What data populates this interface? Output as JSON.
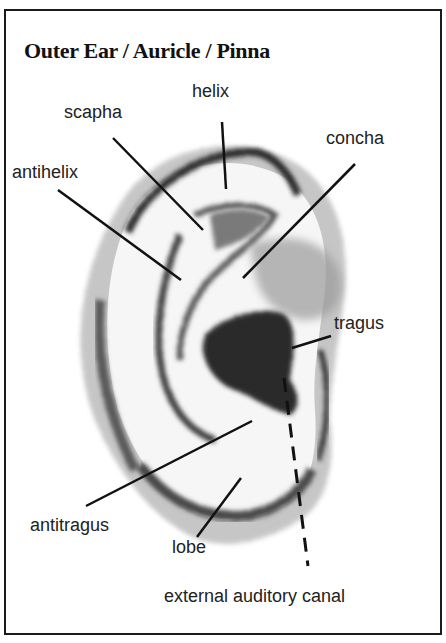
{
  "title": "Outer Ear / Auricle / Pinna",
  "labels": {
    "helix": "helix",
    "scapha": "scapha",
    "concha": "concha",
    "antihelix": "antihelix",
    "tragus": "tragus",
    "antitragus": "antitragus",
    "lobe": "lobe",
    "canal": "external auditory canal"
  },
  "colors": {
    "ink": "#1a1a1a",
    "shade_dark": "#3a3a3a",
    "shade_mid": "#8a8a8a",
    "shade_light": "#c8c8c8",
    "background": "#ffffff"
  }
}
